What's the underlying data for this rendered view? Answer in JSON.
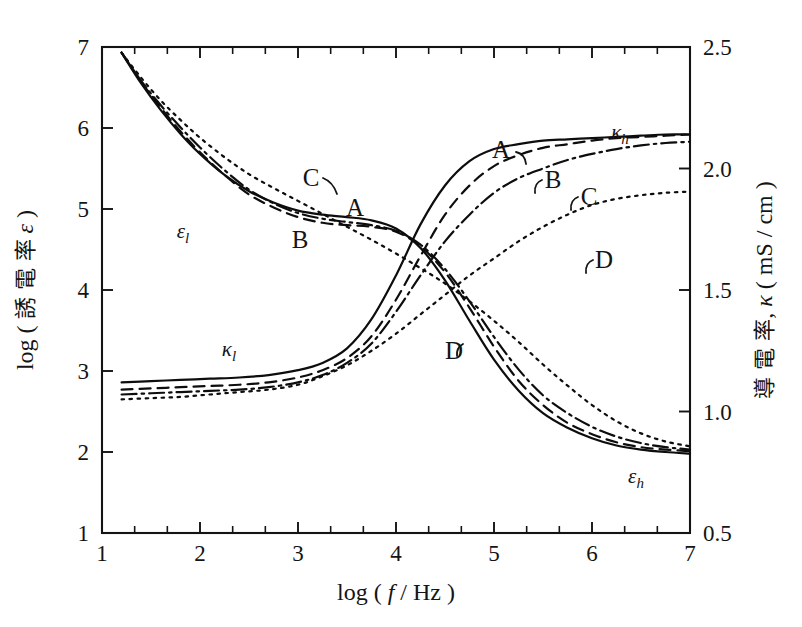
{
  "chart_data": {
    "type": "line",
    "title": "",
    "xlabel": "log ( f / Hz )",
    "ylabel_left": "log ( 誘 電 率  ε )",
    "ylabel_right": "導 電 率,  κ ( mS / cm )",
    "xlim": [
      1,
      7
    ],
    "ylim_left": [
      1,
      7
    ],
    "ylim_right": [
      0.5,
      2.5
    ],
    "grid": false,
    "legend_position": "inline-annotations",
    "x_ticks": [
      "1",
      "2",
      "3",
      "4",
      "5",
      "6",
      "7"
    ],
    "y_ticks_left": [
      "1",
      "2",
      "3",
      "4",
      "5",
      "6",
      "7"
    ],
    "y_ticks_right": [
      "0.5",
      "1.0",
      "1.5",
      "2.0",
      "2.5"
    ],
    "x_minor_ticks_per_interval": 3,
    "annotations": [
      {
        "text": "ε",
        "sub": "l",
        "kind": "greek",
        "x": 183,
        "y": 238
      },
      {
        "text": "ε",
        "sub": "h",
        "kind": "greek",
        "x": 636,
        "y": 483
      },
      {
        "text": "κ",
        "sub": "l",
        "kind": "greek",
        "x": 229,
        "y": 356
      },
      {
        "text": "κ",
        "sub": "h",
        "kind": "greek",
        "x": 620,
        "y": 139
      },
      {
        "text": "A",
        "kind": "curve",
        "x": 355,
        "y": 216
      },
      {
        "text": "B",
        "kind": "curve",
        "x": 300,
        "y": 248
      },
      {
        "text": "C",
        "kind": "curve",
        "x": 311,
        "y": 186
      },
      {
        "text": "A",
        "kind": "curve",
        "x": 501,
        "y": 158
      },
      {
        "text": "B",
        "kind": "curve",
        "x": 553,
        "y": 188
      },
      {
        "text": "C",
        "kind": "curve",
        "x": 589,
        "y": 205
      },
      {
        "text": "D",
        "kind": "curve",
        "x": 604,
        "y": 268
      },
      {
        "text": "D",
        "kind": "curve",
        "x": 454,
        "y": 359
      }
    ],
    "series": [
      {
        "name": "A",
        "line_style": "solid",
        "quantity": "epsilon",
        "x": [
          1.2,
          1.4,
          1.6,
          1.8,
          2.0,
          2.25,
          2.5,
          2.75,
          3.0,
          3.25,
          3.5,
          3.75,
          4.0,
          4.25,
          4.5,
          4.75,
          5.0,
          5.25,
          5.5,
          5.75,
          6.0,
          6.25,
          6.5,
          6.75,
          7.0
        ],
        "y": [
          6.93,
          6.55,
          6.22,
          5.93,
          5.68,
          5.42,
          5.22,
          5.08,
          4.98,
          4.93,
          4.9,
          4.86,
          4.76,
          4.52,
          4.12,
          3.62,
          3.14,
          2.76,
          2.48,
          2.3,
          2.17,
          2.08,
          2.03,
          2.0,
          1.98
        ]
      },
      {
        "name": "B",
        "line_style": "dashed",
        "quantity": "epsilon",
        "x": [
          1.2,
          1.4,
          1.6,
          1.8,
          2.0,
          2.25,
          2.5,
          2.75,
          3.0,
          3.25,
          3.5,
          3.75,
          4.0,
          4.25,
          4.5,
          4.75,
          5.0,
          5.25,
          5.5,
          5.75,
          6.0,
          6.25,
          6.5,
          6.75,
          7.0
        ],
        "y": [
          6.93,
          6.57,
          6.25,
          5.96,
          5.7,
          5.42,
          5.18,
          5.02,
          4.9,
          4.83,
          4.8,
          4.78,
          4.72,
          4.54,
          4.22,
          3.78,
          3.3,
          2.88,
          2.58,
          2.36,
          2.22,
          2.12,
          2.06,
          2.03,
          2.01
        ]
      },
      {
        "name": "C",
        "line_style": "dashdot",
        "quantity": "epsilon",
        "x": [
          1.2,
          1.4,
          1.6,
          1.8,
          2.0,
          2.25,
          2.5,
          2.75,
          3.0,
          3.25,
          3.5,
          3.75,
          4.0,
          4.25,
          4.5,
          4.75,
          5.0,
          5.25,
          5.5,
          5.75,
          6.0,
          6.25,
          6.5,
          6.75,
          7.0
        ],
        "y": [
          6.93,
          6.58,
          6.28,
          6.01,
          5.76,
          5.48,
          5.24,
          5.07,
          4.95,
          4.88,
          4.84,
          4.8,
          4.73,
          4.56,
          4.26,
          3.86,
          3.42,
          3.02,
          2.7,
          2.48,
          2.31,
          2.19,
          2.11,
          2.06,
          2.03
        ]
      },
      {
        "name": "D",
        "line_style": "dotted",
        "quantity": "epsilon",
        "x": [
          1.2,
          1.4,
          1.6,
          1.8,
          2.0,
          2.25,
          2.5,
          2.75,
          3.0,
          3.25,
          3.5,
          3.75,
          4.0,
          4.25,
          4.5,
          4.75,
          5.0,
          5.25,
          5.5,
          5.75,
          6.0,
          6.25,
          6.5,
          6.75,
          7.0
        ],
        "y": [
          6.93,
          6.62,
          6.34,
          6.1,
          5.88,
          5.64,
          5.43,
          5.26,
          5.1,
          4.94,
          4.78,
          4.62,
          4.45,
          4.27,
          4.08,
          3.86,
          3.62,
          3.36,
          3.08,
          2.82,
          2.58,
          2.38,
          2.23,
          2.13,
          2.07
        ]
      },
      {
        "name": "A",
        "line_style": "solid",
        "quantity": "kappa",
        "x": [
          1.2,
          1.5,
          1.8,
          2.1,
          2.4,
          2.7,
          3.0,
          3.25,
          3.5,
          3.75,
          4.0,
          4.25,
          4.5,
          4.75,
          5.0,
          5.25,
          5.5,
          5.75,
          6.0,
          6.25,
          6.5,
          6.75,
          7.0
        ],
        "y": [
          1.12,
          1.125,
          1.13,
          1.135,
          1.14,
          1.15,
          1.17,
          1.2,
          1.26,
          1.38,
          1.56,
          1.77,
          1.93,
          2.03,
          2.08,
          2.1,
          2.115,
          2.12,
          2.125,
          2.13,
          2.135,
          2.14,
          2.14
        ]
      },
      {
        "name": "B",
        "line_style": "dashed",
        "quantity": "kappa",
        "x": [
          1.2,
          1.5,
          1.8,
          2.1,
          2.4,
          2.7,
          3.0,
          3.25,
          3.5,
          3.75,
          4.0,
          4.25,
          4.5,
          4.75,
          5.0,
          5.25,
          5.5,
          5.75,
          6.0,
          6.25,
          6.5,
          6.75,
          7.0
        ],
        "y": [
          1.09,
          1.095,
          1.1,
          1.105,
          1.11,
          1.12,
          1.14,
          1.17,
          1.22,
          1.31,
          1.46,
          1.64,
          1.81,
          1.93,
          2.01,
          2.055,
          2.085,
          2.1,
          2.115,
          2.125,
          2.13,
          2.135,
          2.14
        ]
      },
      {
        "name": "C",
        "line_style": "dashdot",
        "quantity": "kappa",
        "x": [
          1.2,
          1.5,
          1.8,
          2.1,
          2.4,
          2.7,
          3.0,
          3.25,
          3.5,
          3.75,
          4.0,
          4.25,
          4.5,
          4.75,
          5.0,
          5.25,
          5.5,
          5.75,
          6.0,
          6.25,
          6.5,
          6.75,
          7.0
        ],
        "y": [
          1.07,
          1.075,
          1.08,
          1.085,
          1.09,
          1.1,
          1.12,
          1.15,
          1.2,
          1.28,
          1.41,
          1.56,
          1.7,
          1.81,
          1.9,
          1.96,
          2.0,
          2.035,
          2.06,
          2.08,
          2.095,
          2.105,
          2.11
        ]
      },
      {
        "name": "D",
        "line_style": "dotted",
        "quantity": "kappa",
        "x": [
          1.2,
          1.5,
          1.8,
          2.1,
          2.4,
          2.7,
          3.0,
          3.25,
          3.5,
          3.75,
          4.0,
          4.25,
          4.5,
          4.75,
          5.0,
          5.25,
          5.5,
          5.75,
          6.0,
          6.25,
          6.5,
          6.75,
          7.0
        ],
        "y": [
          1.05,
          1.055,
          1.06,
          1.07,
          1.08,
          1.09,
          1.11,
          1.145,
          1.19,
          1.25,
          1.32,
          1.4,
          1.48,
          1.56,
          1.63,
          1.7,
          1.76,
          1.81,
          1.85,
          1.875,
          1.89,
          1.9,
          1.905
        ]
      }
    ]
  }
}
